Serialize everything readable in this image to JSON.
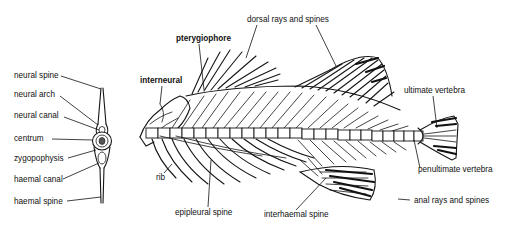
{
  "figure": {
    "background": "#ffffff",
    "ink_color": "#111111"
  },
  "vertebra_labels": [
    {
      "id": "neural-spine",
      "text": "neural spine"
    },
    {
      "id": "neural-arch",
      "text": "neural arch"
    },
    {
      "id": "neural-canal",
      "text": "neural canal"
    },
    {
      "id": "centrum",
      "text": "centrum"
    },
    {
      "id": "zygopophysis",
      "text": "zygopophysis"
    },
    {
      "id": "haemal-canal",
      "text": "haemal canal"
    },
    {
      "id": "haemal-spine",
      "text": "haemal spine"
    }
  ],
  "skeleton_labels": {
    "dorsal_rays": "dorsal rays and spines",
    "pterygiophore": "pterygiophore",
    "interneural": "interneural",
    "ultimate_vertebra": "ultimate vertebra",
    "penultimate_vertebra": "penultimate vertebra",
    "anal_rays": "anal rays and spines",
    "interhaemal_spine": "interhaemal spine",
    "epipleural_spine": "epipleural spine",
    "rib": "rib"
  }
}
